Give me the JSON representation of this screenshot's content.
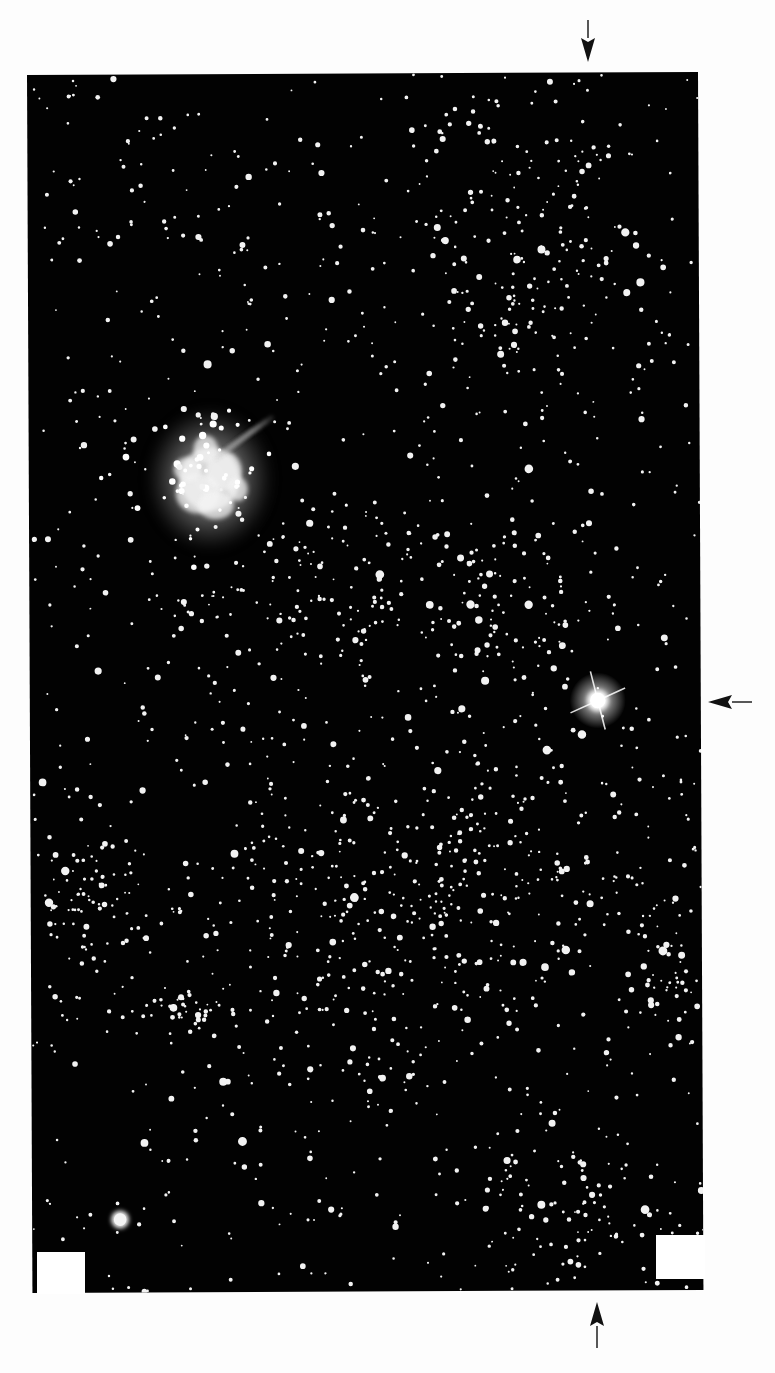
{
  "page": {
    "width": 775,
    "height": 1373,
    "background": "#fdfdfd"
  },
  "plate": {
    "description": "Photographic star field plate with emission nebula and bright star",
    "corners": {
      "top_left": [
        27,
        75
      ],
      "top_right": [
        698,
        72
      ],
      "bottom_left": [
        36,
        1293
      ],
      "bottom_right": [
        704,
        1290
      ]
    },
    "background": "#020202",
    "star_color": "#f2f2f2",
    "star_seed": 20231,
    "star_count_uniform": 900,
    "clusters": [
      {
        "name": "upper-right-cluster",
        "cx": 520,
        "cy": 260,
        "rx": 110,
        "ry": 150,
        "count": 170
      },
      {
        "name": "central-rich-field",
        "cx": 430,
        "cy": 900,
        "rx": 230,
        "ry": 170,
        "count": 420
      },
      {
        "name": "middle-band",
        "cx": 400,
        "cy": 600,
        "rx": 230,
        "ry": 80,
        "count": 200
      },
      {
        "name": "left-lower-cluster",
        "cx": 80,
        "cy": 900,
        "rx": 55,
        "ry": 70,
        "count": 70
      },
      {
        "name": "lower-left-group",
        "cx": 185,
        "cy": 1015,
        "rx": 40,
        "ry": 25,
        "count": 40
      },
      {
        "name": "lower-right-field",
        "cx": 560,
        "cy": 1200,
        "rx": 120,
        "ry": 80,
        "count": 90
      },
      {
        "name": "right-edge-group",
        "cx": 660,
        "cy": 980,
        "rx": 40,
        "ry": 60,
        "count": 35
      }
    ],
    "objects": {
      "nebula": {
        "name": "emission-nebula",
        "cx": 208,
        "cy": 480,
        "rx": 55,
        "ry": 65
      },
      "bright_star": {
        "name": "bright-star",
        "cx": 595,
        "cy": 703,
        "r": 14,
        "spike_length": 30
      },
      "knot_star": {
        "name": "lower-left-bright-knot",
        "cx": 115,
        "cy": 1220,
        "r": 9
      }
    }
  },
  "label_patches": [
    {
      "name": "label-patch-bottom-left",
      "x": 37,
      "y": 1252,
      "w": 48,
      "h": 42
    },
    {
      "name": "label-patch-bottom-right",
      "x": 656,
      "y": 1235,
      "w": 49,
      "h": 44
    }
  ],
  "arrows": [
    {
      "name": "arrow-top-pointing-down",
      "direction": "down",
      "tip": [
        588,
        62
      ],
      "tail": [
        588,
        20
      ]
    },
    {
      "name": "arrow-right-pointing-left",
      "direction": "left",
      "tip": [
        708,
        702
      ],
      "tail": [
        752,
        702
      ]
    },
    {
      "name": "arrow-bottom-pointing-up",
      "direction": "up",
      "tip": [
        597,
        1302
      ],
      "tail": [
        597,
        1348
      ]
    }
  ],
  "colors": {
    "arrow": "#111111",
    "nebula_core": "#f4f4f4",
    "nebula_halo": "#bfbfbf"
  }
}
